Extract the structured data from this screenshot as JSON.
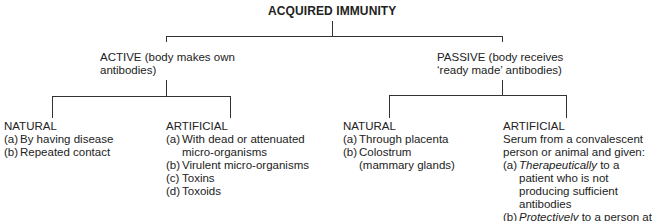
{
  "title": "ACQUIRED IMMUNITY",
  "active": {
    "label": "ACTIVE (body makes own antibodies)",
    "line1": "ACTIVE (body makes own",
    "line2": "antibodies)",
    "natural": {
      "heading": "NATURAL",
      "items": [
        {
          "marker": "(a)",
          "text": "By having disease"
        },
        {
          "marker": "(b)",
          "text": "Repeated contact"
        }
      ]
    },
    "artificial": {
      "heading": "ARTIFICIAL",
      "items": [
        {
          "marker": "(a)",
          "text": "With dead or attenuated micro-organisms"
        },
        {
          "marker": "(b)",
          "text": "Virulent micro-organisms"
        },
        {
          "marker": "(c)",
          "text": "Toxins"
        },
        {
          "marker": "(d)",
          "text": "Toxoids"
        }
      ]
    }
  },
  "passive": {
    "label": "PASSIVE (body receives 'ready made' antibodies)",
    "line1": "PASSIVE (body receives",
    "line2": "‘ready made’ antibodies)",
    "natural": {
      "heading": "NATURAL",
      "items": [
        {
          "marker": "(a)",
          "text": "Through placenta"
        },
        {
          "marker": "(b)",
          "text": "Colostrum (mammary glands)"
        }
      ]
    },
    "artificial": {
      "heading": "ARTIFICIAL",
      "intro": "Serum from a convalescent person or animal and given:",
      "items": [
        {
          "marker": "(a)",
          "emph": "Therapeutically",
          "text": " to a patient who is not producing sufficient antibodies"
        },
        {
          "marker": "(b)",
          "emph": "Protectively",
          "text": " to a person at risk"
        }
      ]
    }
  }
}
